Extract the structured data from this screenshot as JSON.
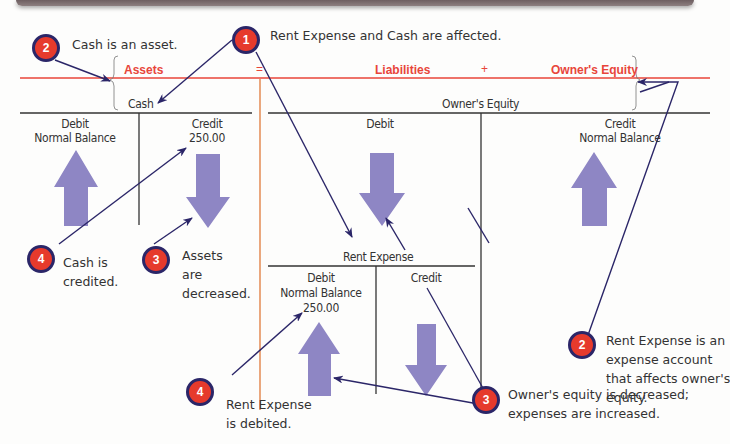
{
  "equation": {
    "assets": "Assets",
    "equals": "=",
    "liabilities": "Liabilities",
    "plus": "+",
    "owners_equity": "Owner's Equity"
  },
  "accounts": {
    "cash": {
      "title": "Cash",
      "debit_label": "Debit",
      "debit_sub": "Normal Balance",
      "credit_label": "Credit",
      "credit_amount": "250.00"
    },
    "owners_equity": {
      "title": "Owner's Equity",
      "debit_label": "Debit",
      "credit_label": "Credit",
      "credit_sub": "Normal Balance"
    },
    "rent_expense": {
      "title": "Rent Expense",
      "debit_label": "Debit",
      "debit_sub": "Normal Balance",
      "debit_amount": "250.00",
      "credit_label": "Credit"
    }
  },
  "callouts": [
    {
      "number": "1",
      "text": "Rent Expense and Cash are affected."
    },
    {
      "number": "2",
      "text": "Cash is an asset."
    },
    {
      "number": "2",
      "lines": [
        "Rent Expense is an",
        "expense account",
        "that affects owner's",
        "equity."
      ]
    },
    {
      "number": "3",
      "lines": [
        "Assets",
        "are",
        "decreased."
      ]
    },
    {
      "number": "3",
      "lines": [
        "Owner's equity is decreased;",
        "expenses are increased."
      ]
    },
    {
      "number": "4",
      "lines": [
        "Cash is",
        "credited."
      ]
    },
    {
      "number": "4",
      "lines": [
        "Rent Expense",
        "is debited."
      ]
    }
  ],
  "colors": {
    "accent_red": "#e8453a",
    "badge_red": "#e63a2c",
    "badge_border": "#2b2668",
    "arrow_purple": "#8e86c4",
    "pointer_navy": "#2b2668",
    "divider_orange": "#e07a3a"
  }
}
